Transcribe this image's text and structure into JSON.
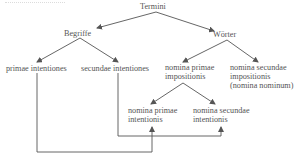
{
  "diagram": {
    "root": "Termini",
    "branches": {
      "left": "Begriffe",
      "right": "Wörter"
    },
    "begriffe_children": [
      "primae intentiones",
      "secundae intentiones"
    ],
    "woerter_children": {
      "primae": [
        "nomina primae",
        "impositionis"
      ],
      "secundae": [
        "nomina secundae",
        "impositionis",
        "(nomina nominum)"
      ]
    },
    "impositionis_children": {
      "primae": [
        "nomina primae",
        "intentionis"
      ],
      "secundae": [
        "nomina secundae",
        "intentionis"
      ]
    },
    "connections": [
      {
        "from": "primae intentiones",
        "to": "nomina primae intentionis"
      },
      {
        "from": "secundae intentiones",
        "to": "nomina secundae intentionis"
      }
    ],
    "line_color": "#555555"
  }
}
